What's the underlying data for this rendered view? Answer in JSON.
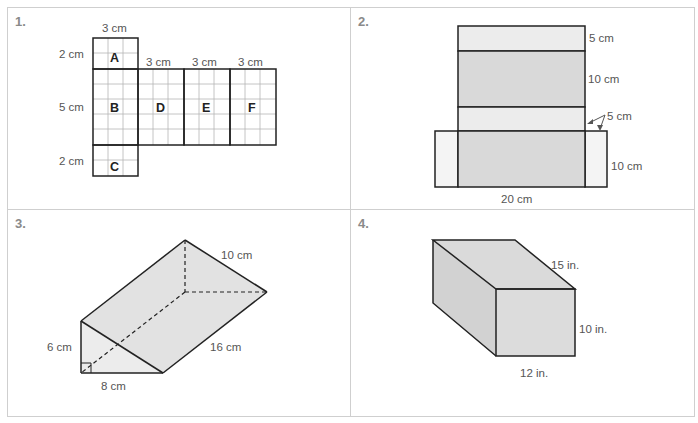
{
  "problems": [
    {
      "number": "1.",
      "figure": "net-rectangular-prism",
      "labels": {
        "top_width": "3 cm",
        "a_height": "2 cm",
        "b_height": "5 cm",
        "c_height": "2 cm",
        "d_width": "3 cm",
        "e_width": "3 cm",
        "f_width": "3 cm"
      },
      "faces": [
        "A",
        "B",
        "C",
        "D",
        "E",
        "F"
      ]
    },
    {
      "number": "2.",
      "figure": "net-rectangular-prism-shaded",
      "labels": {
        "top_strip": "5 cm",
        "middle_face": "10 cm",
        "lower_strip": "5 cm",
        "bottom_face": "10 cm",
        "width": "20 cm"
      }
    },
    {
      "number": "3.",
      "figure": "triangular-prism",
      "labels": {
        "hypotenuse": "10 cm",
        "height": "6 cm",
        "base": "8 cm",
        "length": "16 cm"
      }
    },
    {
      "number": "4.",
      "figure": "rectangular-prism",
      "labels": {
        "depth": "15 in.",
        "height": "10 in.",
        "width": "12 in."
      }
    }
  ],
  "colors": {
    "border": "#cfcfcf",
    "line": "#222222",
    "grid": "#b5b5b5",
    "shade_light": "#ececec",
    "shade_dark": "#d9d9d9",
    "label": "#555555",
    "number": "#8a8a8a"
  }
}
